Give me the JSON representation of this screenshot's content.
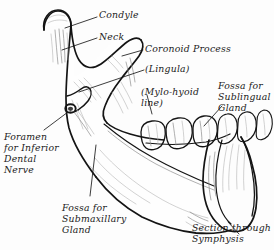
{
  "figure": {
    "background_color": "#fdfdfd",
    "ink_color": "#141414",
    "shading_color": "#8e8e8e",
    "style": "pen-and-ink anatomical line drawing"
  },
  "labels": {
    "condyle": "Condyle",
    "neck": "Neck",
    "coronoid_process": "Coronoid Process",
    "lingula": "(Lingula)",
    "mylo_hyoid_line_1": "(Mylo-hyoid",
    "mylo_hyoid_line_2": "line)",
    "fossa_sublingual_1": "Fossa for",
    "fossa_sublingual_2": "Sublingual",
    "fossa_sublingual_3": "Gland",
    "foramen_1": "Foramen",
    "foramen_2": "for Inferior",
    "foramen_3": "Dental",
    "foramen_4": "Nerve",
    "fossa_submaxillary_1": "Fossa for",
    "fossa_submaxillary_2": "Submaxillary",
    "fossa_submaxillary_3": "Gland",
    "section_symphysis_1": "Section through",
    "section_symphysis_2": "Symphysis"
  }
}
